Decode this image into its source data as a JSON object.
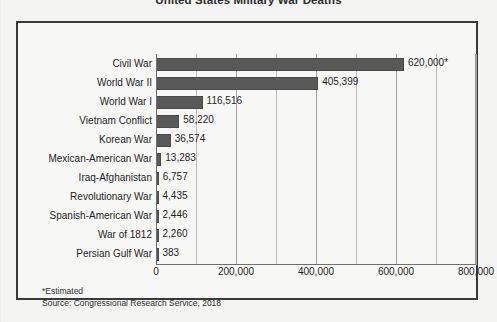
{
  "chart_data": {
    "type": "bar",
    "orientation": "horizontal",
    "title": "United States Military War Deaths",
    "xlabel": "",
    "ylabel": "",
    "xlim": [
      0,
      800000
    ],
    "grid": true,
    "grid_interval": 100000,
    "legend": "none",
    "categories": [
      "Civil War",
      "World War II",
      "World War I",
      "Vietnam Conflict",
      "Korean War",
      "Mexican-American War",
      "Iraq-Afghanistan",
      "Revolutionary War",
      "Spanish-American War",
      "War of 1812",
      "Persian Gulf War"
    ],
    "values": [
      620000,
      405399,
      116516,
      58220,
      36574,
      13283,
      6757,
      4435,
      2446,
      2260,
      383
    ],
    "value_labels": [
      "620,000*",
      "405,399",
      "116,516",
      "58,220",
      "36,574",
      "13,283",
      "6,757",
      "4,435",
      "2,446",
      "2,260",
      "383"
    ],
    "xticks": [
      0,
      200000,
      400000,
      600000,
      800000
    ],
    "xtick_labels": [
      "0",
      "200,000",
      "400,000",
      "600,000",
      "800,000"
    ],
    "bar_color": "#595959",
    "annotations": [
      "*Estimated"
    ],
    "source": "Source: Congressional Research Service, 2018"
  },
  "footnotes": {
    "estimated": "*Estimated",
    "source": "Source: Congressional Research Service, 2018"
  }
}
